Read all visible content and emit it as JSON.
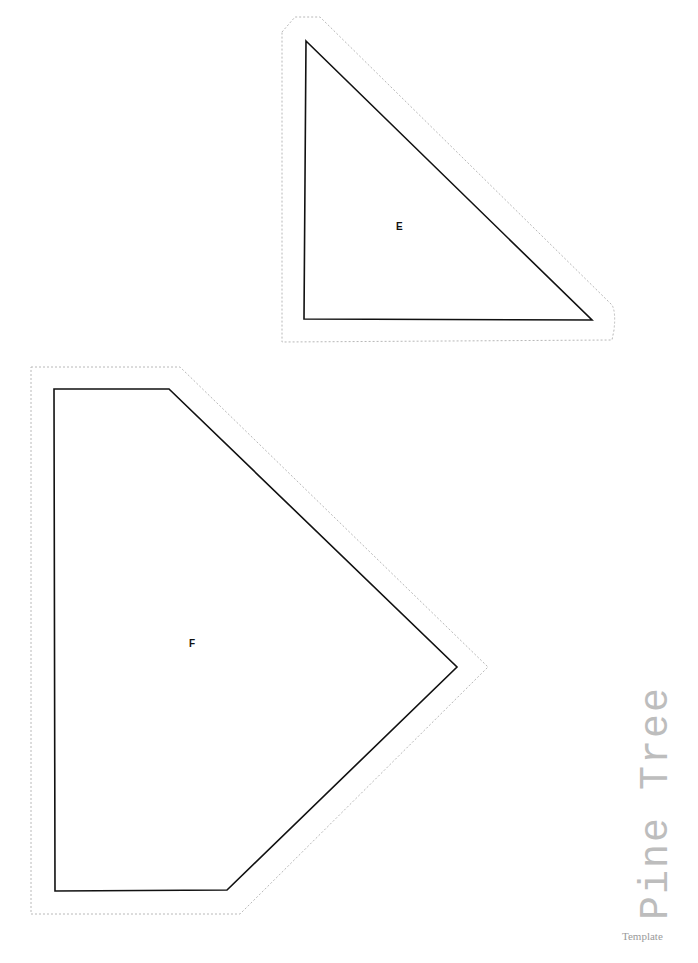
{
  "document": {
    "title": "Pine Tree",
    "subtitle": "Template"
  },
  "pieces": [
    {
      "label": "E",
      "shape": "right-triangle"
    },
    {
      "label": "F",
      "shape": "pentagon"
    }
  ],
  "colors": {
    "outline": "#111111",
    "cut_line": "#b8b8b8",
    "title": "#bdbdbd"
  }
}
